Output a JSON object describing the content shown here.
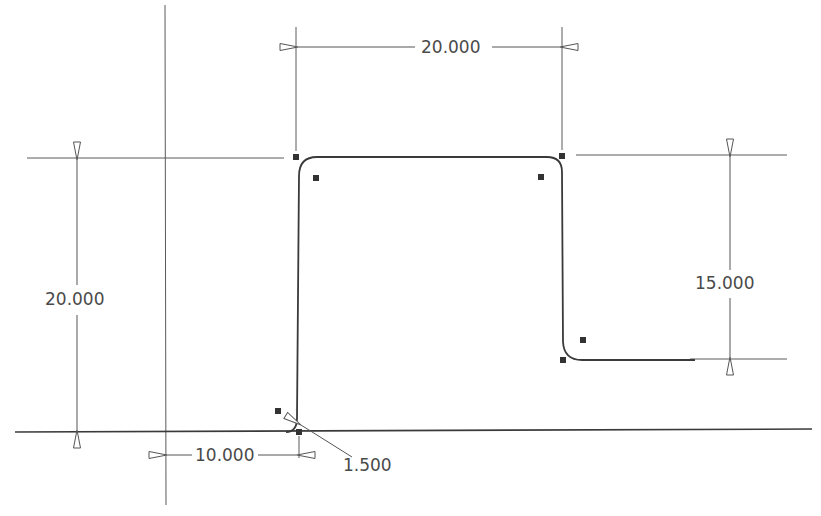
{
  "sketch": {
    "dimensions": {
      "top_width": {
        "value": "20.000"
      },
      "left_height": {
        "value": "20.000"
      },
      "right_height": {
        "value": "15.000"
      },
      "bottom_offset": {
        "value": "10.000"
      },
      "fillet_radius": {
        "value": "1.500"
      }
    },
    "colors": {
      "profile": "#3a3a3a",
      "construction": "#5a5a5a",
      "point": "#333333",
      "text": "#4a4a4a"
    }
  }
}
